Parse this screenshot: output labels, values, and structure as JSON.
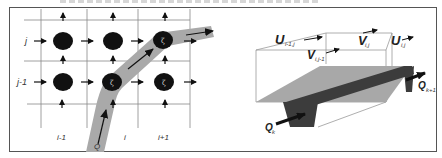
{
  "figure": {
    "left_panel": {
      "title": "Staggered grid with flow path",
      "row_labels": [
        "j",
        "j-1"
      ],
      "column_labels": [
        "i-1",
        "i",
        "i+1"
      ],
      "node_symbol": "ζ",
      "flow_label": "Q",
      "nodes": [
        {
          "row": "j",
          "col": "i-1",
          "label": ""
        },
        {
          "row": "j",
          "col": "i",
          "label": ""
        },
        {
          "row": "j",
          "col": "i+1",
          "label": "ζ"
        },
        {
          "row": "j-1",
          "col": "i-1",
          "label": ""
        },
        {
          "row": "j-1",
          "col": "i",
          "label": "ζ"
        },
        {
          "row": "j-1",
          "col": "i+1",
          "label": "ζ"
        }
      ]
    },
    "right_panel": {
      "title": "Control volume with channel",
      "labels": {
        "u_left": "U",
        "u_left_sub": "i-1,j",
        "v_top": "V",
        "v_top_sub": "i,j",
        "u_right": "U",
        "u_right_sub": "i,j",
        "v_bottom": "V",
        "v_bottom_sub": "i,j-1",
        "q_in": "Q",
        "q_in_sub": "k",
        "q_out": "Q",
        "q_out_sub": "k+1"
      }
    },
    "colors": {
      "grid_line": "#888888",
      "node_fill": "#111111",
      "path_fill": "#a9a9a9",
      "surface_light": "#a8a8a8",
      "channel_dark": "#3c3c3c",
      "arrow": "#111111"
    }
  }
}
